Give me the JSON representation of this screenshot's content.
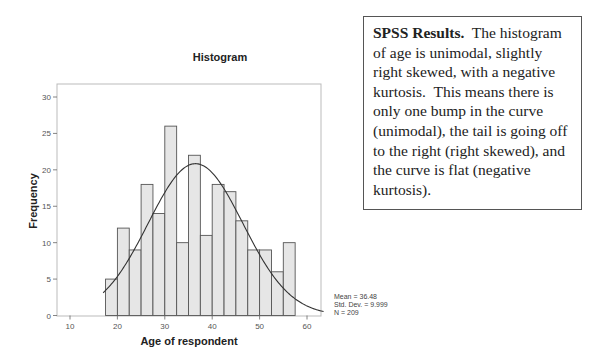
{
  "note": {
    "heading": "SPSS Results.",
    "body": "  The histogram of age is unimodal, slightly right skewed, with a negative kurtosis.  This means there is only one bump in the curve (unimodal), the tail is going off to the right (right skewed), and the curve is flat (negative kurtosis)."
  },
  "chart_data": {
    "type": "bar",
    "title": "Histogram",
    "xlabel": "Age of respondent",
    "ylabel": "Frequency",
    "bin_edges": [
      17.5,
      20,
      22.5,
      25,
      27.5,
      30,
      32.5,
      35,
      37.5,
      40,
      42.5,
      45,
      47.5,
      50,
      52.5,
      55,
      57.5
    ],
    "categories": [
      "17.5-20",
      "20-22.5",
      "22.5-25",
      "25-27.5",
      "27.5-30",
      "30-32.5",
      "32.5-35",
      "35-37.5",
      "37.5-40",
      "40-42.5",
      "42.5-45",
      "45-47.5",
      "47.5-50",
      "50-52.5",
      "52.5-55",
      "55-57.5"
    ],
    "values": [
      5,
      12,
      9,
      18,
      14,
      26,
      10,
      22,
      11,
      18,
      17,
      13,
      9,
      9,
      6,
      10
    ],
    "xticks": [
      10,
      20,
      30,
      40,
      50,
      60
    ],
    "yticks": [
      0,
      5,
      10,
      15,
      20,
      25,
      30
    ],
    "xlim": [
      5,
      67
    ],
    "ylim": [
      0,
      32
    ],
    "grid": false,
    "bar_color": "#e6e6e6",
    "bar_edge_color": "#555555",
    "normal_curve": {
      "mean": 36.48,
      "std": 9.999,
      "n": 209,
      "bin_width": 2.5
    },
    "legend": {
      "position": "bottom-right-outside",
      "lines": [
        "Mean = 36.48",
        "Std. Dev. = 9.999",
        "N = 209"
      ]
    }
  }
}
